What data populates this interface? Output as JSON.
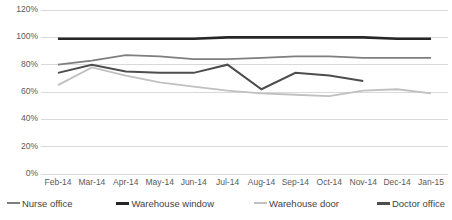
{
  "chart_data": {
    "type": "line",
    "title": "",
    "subtitle": "",
    "xlabel": "",
    "ylabel": "",
    "ylim": [
      0,
      120
    ],
    "y_tick_step": 20,
    "grid": true,
    "grid_axis": "y",
    "legend_position": "bottom",
    "categories": [
      "Feb-14",
      "Mar-14",
      "Apr-14",
      "May-14",
      "Jun-14",
      "Jul-14",
      "Aug-14",
      "Sep-14",
      "Oct-14",
      "Nov-14",
      "Dec-14",
      "Jan-15"
    ],
    "y_tick_labels": [
      "0%",
      "20%",
      "40%",
      "60%",
      "80%",
      "100%",
      "120%"
    ],
    "y_tick_values": [
      0,
      20,
      40,
      60,
      80,
      100,
      120
    ],
    "series": [
      {
        "name": "Nurse office",
        "color": "#7f7f7f",
        "width": 1.8,
        "values": [
          80,
          83,
          87,
          86,
          84,
          84,
          85,
          86,
          86,
          85,
          85,
          85
        ]
      },
      {
        "name": "Warehouse window",
        "color": "#262626",
        "width": 2.6,
        "values": [
          99,
          99,
          99,
          99,
          99,
          100,
          100,
          100,
          100,
          100,
          99,
          99
        ]
      },
      {
        "name": "Warehouse door",
        "color": "#c0c0c0",
        "width": 1.8,
        "values": [
          65,
          78,
          72,
          67,
          64,
          61,
          59,
          58,
          57,
          61,
          62,
          59
        ]
      },
      {
        "name": "Doctor office",
        "color": "#4d4d4d",
        "width": 2.0,
        "values": [
          74,
          80,
          75,
          74,
          74,
          80,
          62,
          74,
          72,
          68,
          null,
          null
        ]
      }
    ]
  },
  "legend": {
    "items": [
      {
        "label": "Nurse office",
        "color": "#7f7f7f",
        "width": 2
      },
      {
        "label": "Warehouse window",
        "color": "#262626",
        "width": 3
      },
      {
        "label": "Warehouse door",
        "color": "#c0c0c0",
        "width": 2
      },
      {
        "label": "Doctor office",
        "color": "#4d4d4d",
        "width": 3
      }
    ]
  },
  "clipped_caption": {
    "text": ""
  },
  "style": {
    "background": "#ffffff",
    "gridline_color": "#d9d9d9",
    "axis_text_color": "#5a5a5a"
  }
}
